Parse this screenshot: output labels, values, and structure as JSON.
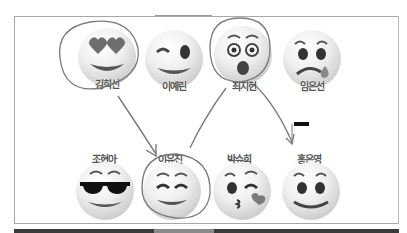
{
  "slide": {
    "top_row": [
      {
        "name": "김희선",
        "emoji": "heart-eyes"
      },
      {
        "name": "이예린",
        "emoji": "wink"
      },
      {
        "name": "최지현",
        "emoji": "surprised"
      },
      {
        "name": "임은선",
        "emoji": "crying"
      }
    ],
    "bottom_row": [
      {
        "name": "조현아",
        "emoji": "sunglasses"
      },
      {
        "name": "이유진",
        "emoji": "smiling-eyes"
      },
      {
        "name": "박슈희",
        "emoji": "kissing-heart"
      },
      {
        "name": "홍은영",
        "emoji": "slight-smile"
      }
    ]
  },
  "colors": {
    "ink": "#7a7a7a",
    "face_light": "#f0f0f0",
    "face_dark": "#a9a9a9"
  }
}
